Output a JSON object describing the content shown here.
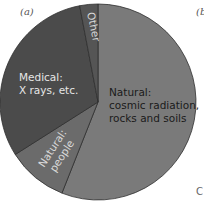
{
  "panel_labels": {
    "a": "(a)",
    "b": "(b",
    "c_fragment": "C"
  },
  "chart_data": {
    "type": "pie",
    "title": "",
    "start_angle_deg": 0,
    "direction": "clockwise",
    "slices": [
      {
        "label": "Natural: cosmic radiation, rocks and soils",
        "label_lines": [
          "Natural:",
          "cosmic radiation,",
          "rocks and soils"
        ],
        "value": 56,
        "color": "#7a7a7a",
        "text_color": "#1a1a1a"
      },
      {
        "label": "Natural: people",
        "label_lines": [
          "Natural:",
          "people"
        ],
        "value": 10,
        "color": "#6b6b6b",
        "text_color": "#d8d8d8"
      },
      {
        "label": "Medical: X rays, etc.",
        "label_lines": [
          "Medical:",
          "X rays, etc."
        ],
        "value": 31,
        "color": "#4b4b4b",
        "text_color": "#e6e6e6"
      },
      {
        "label": "Other",
        "label_lines": [
          "Other"
        ],
        "value": 3,
        "color": "#555555",
        "text_color": "#d8d8d8"
      }
    ],
    "legend": "none (labels inside slices)"
  }
}
